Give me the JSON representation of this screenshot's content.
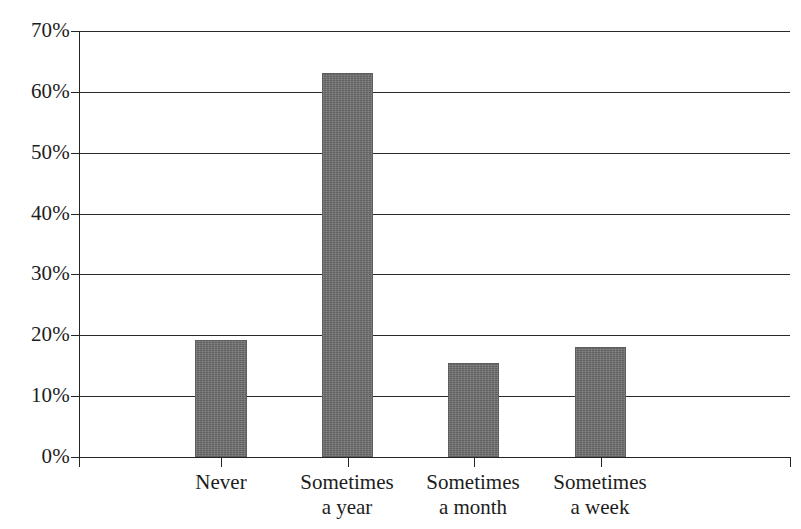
{
  "chart_data": {
    "type": "bar",
    "title": "",
    "subtitle": "",
    "xlabel": "",
    "ylabel": "",
    "categories": [
      "Never",
      "Sometimes\na year",
      "Sometimes\na month",
      "Sometimes\na week"
    ],
    "values": [
      19.2,
      63.1,
      15.5,
      18.1
    ],
    "ylim": [
      0,
      70
    ],
    "y_ticks": [
      0,
      10,
      20,
      30,
      40,
      50,
      60,
      70
    ],
    "y_tick_labels": [
      "0%",
      "10%",
      "20%",
      "30%",
      "40%",
      "50%",
      "60%",
      "70%"
    ],
    "grid": true,
    "legend": null,
    "series": [
      {
        "name": "",
        "values": [
          19.2,
          63.1,
          15.5,
          18.1
        ]
      }
    ],
    "colors": {
      "bar_fill": "#6e6e6e",
      "axis": "#242424",
      "gridline": "#2b2b2b",
      "text": "#1d1d1d",
      "background": "#ffffff"
    }
  }
}
